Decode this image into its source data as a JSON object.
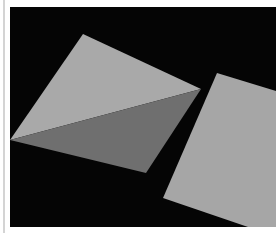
{
  "viewport": {
    "label": "3D render viewport",
    "background_color": "#050505",
    "shapes": [
      {
        "name": "left-quad-upper-face",
        "color": "#a9a9a9",
        "points": "73,27 191,82 0,133"
      },
      {
        "name": "left-quad-lower-face",
        "color": "#6f6f6f",
        "points": "0,133 191,82 136,166"
      },
      {
        "name": "right-plane",
        "color": "#a6a6a6",
        "points": "207,66 266,84 266,220 238,220 153,191"
      }
    ]
  },
  "colors": {
    "frame_line": "#d4d4d4",
    "page_background": "#ffffff"
  }
}
